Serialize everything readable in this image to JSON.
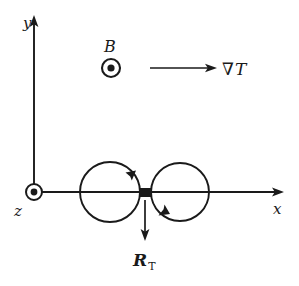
{
  "figure": {
    "kind": "physics-vector-diagram",
    "background_color": "#ffffff",
    "stroke_color": "#1a1a1a",
    "width": 299,
    "height": 286
  },
  "axes": {
    "y_label": "y",
    "x_label": "x",
    "z_label": "z",
    "origin": {
      "x": 34,
      "y": 192
    },
    "y_axis": {
      "from_y": 192,
      "to_y": 17
    },
    "x_axis": {
      "from_x": 34,
      "to_x": 283
    }
  },
  "magnetic_field": {
    "label": "B",
    "symbol_name": "dot-out-of-page",
    "center": {
      "x": 111,
      "y": 68
    },
    "outer_radius": 9,
    "inner_radius": 3.5
  },
  "z_axis_symbol": {
    "symbol_name": "dot-out-of-page",
    "center": {
      "x": 34,
      "y": 192
    },
    "outer_radius": 8,
    "inner_radius": 3.4
  },
  "gradient_arrow": {
    "label": "∇T",
    "nabla": "∇",
    "variable": "T",
    "from": {
      "x": 150,
      "y": 68
    },
    "to": {
      "x": 216,
      "y": 68
    }
  },
  "orbits": {
    "left": {
      "center": {
        "x": 110,
        "y": 192
      },
      "radius": 30,
      "arrow_name": "counterclockwise-arrowhead"
    },
    "right": {
      "center": {
        "x": 180,
        "y": 192
      },
      "radius": 29,
      "arrow_name": "clockwise-arrowhead"
    }
  },
  "scatterer": {
    "name": "impurity-block",
    "x": 139,
    "y": 188,
    "width": 13,
    "height": 9,
    "color": "#1a1a1a"
  },
  "response_vector": {
    "label_main": "R",
    "label_sub": "T",
    "from": {
      "x": 145,
      "y": 200
    },
    "to": {
      "x": 145,
      "y": 240
    },
    "label_position": {
      "x": 145,
      "y": 261
    }
  }
}
